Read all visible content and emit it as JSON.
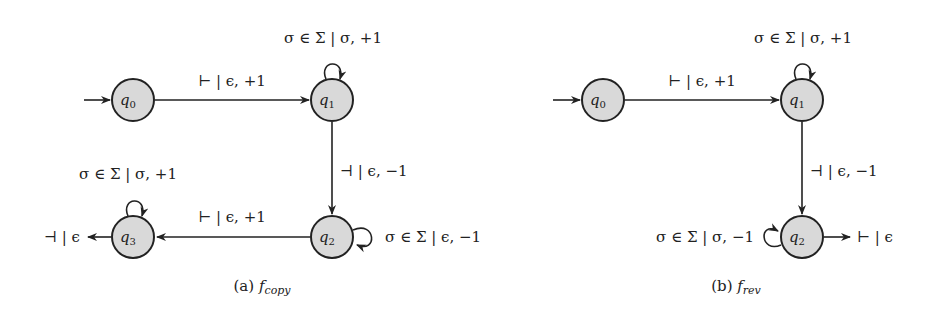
{
  "figure": {
    "colors": {
      "state_fill": "#d9d9d9",
      "stroke": "#222222",
      "background": "#ffffff"
    },
    "diagrams": [
      {
        "id": "copy",
        "caption": {
          "prefix": "(a)",
          "func": "f",
          "sub": "copy"
        },
        "states": [
          {
            "name": "q",
            "index": "0",
            "initial": true
          },
          {
            "name": "q",
            "index": "1"
          },
          {
            "name": "q",
            "index": "2"
          },
          {
            "name": "q",
            "index": "3"
          }
        ],
        "transitions": [
          {
            "from": "q0",
            "to": "q1",
            "label": "⊢ | ϵ, +1"
          },
          {
            "from": "q1",
            "to": "q1",
            "label": "σ ∈ Σ | σ, +1"
          },
          {
            "from": "q1",
            "to": "q2",
            "label": "⊣ | ϵ, −1"
          },
          {
            "from": "q2",
            "to": "q2",
            "label": "σ ∈ Σ | ϵ, −1"
          },
          {
            "from": "q2",
            "to": "q3",
            "label": "⊢ | ϵ, +1"
          },
          {
            "from": "q3",
            "to": "q3",
            "label": "σ ∈ Σ | σ, +1"
          },
          {
            "from": "q3",
            "to": "out",
            "label": "⊣ | ϵ"
          }
        ]
      },
      {
        "id": "rev",
        "caption": {
          "prefix": "(b)",
          "func": "f",
          "sub": "rev"
        },
        "states": [
          {
            "name": "q",
            "index": "0",
            "initial": true
          },
          {
            "name": "q",
            "index": "1"
          },
          {
            "name": "q",
            "index": "2"
          }
        ],
        "transitions": [
          {
            "from": "q0",
            "to": "q1",
            "label": "⊢ | ϵ, +1"
          },
          {
            "from": "q1",
            "to": "q1",
            "label": "σ ∈ Σ | σ, +1"
          },
          {
            "from": "q1",
            "to": "q2",
            "label": "⊣ | ϵ, −1"
          },
          {
            "from": "q2",
            "to": "q2",
            "label": "σ ∈ Σ | σ, −1"
          },
          {
            "from": "q2",
            "to": "out",
            "label": "⊢ | ϵ"
          }
        ]
      }
    ]
  }
}
